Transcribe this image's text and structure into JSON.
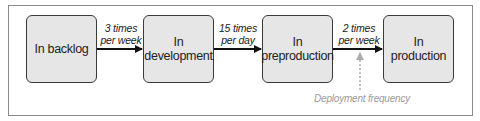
{
  "diagram": {
    "stages": [
      {
        "label": "In backlog"
      },
      {
        "label": "In\ndevelopment"
      },
      {
        "label": "In\npreproduction"
      },
      {
        "label": "In\nproduction"
      }
    ],
    "transitions": [
      {
        "from": "In backlog",
        "to": "In development",
        "label_line1": "3 times",
        "label_line2": "per week"
      },
      {
        "from": "In development",
        "to": "In preproduction",
        "label_line1": "15 times",
        "label_line2": "per day"
      },
      {
        "from": "In preproduction",
        "to": "In production",
        "label_line1": "2 times",
        "label_line2": "per week"
      }
    ],
    "annotation": {
      "label": "Deployment frequency",
      "points_to": "In preproduction → In production"
    },
    "colors": {
      "box_fill": "#e6e6e6",
      "box_border": "#3a3a3a",
      "arrow": "#111111",
      "annotation": "#9a9a9a"
    }
  }
}
